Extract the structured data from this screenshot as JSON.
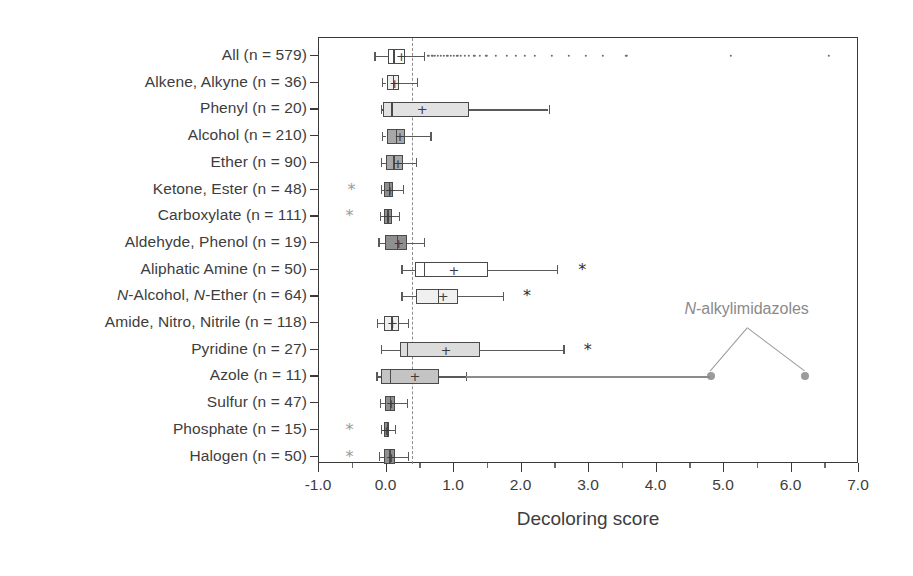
{
  "chart_data": {
    "type": "box",
    "title": "",
    "xlabel": "Decoloring score",
    "ylabel": "",
    "xlim": [
      -1.0,
      7.0
    ],
    "xticks": [
      "-1.0",
      "0.0",
      "1.0",
      "2.0",
      "3.0",
      "4.0",
      "5.0",
      "6.0",
      "7.0"
    ],
    "xtick_values": [
      -1.0,
      0.0,
      1.0,
      2.0,
      3.0,
      4.0,
      5.0,
      6.0,
      7.0
    ],
    "minor_ticks": true,
    "grid": false,
    "reference_line": {
      "value": 0.38,
      "style": "dashed",
      "color": "#8e8e8e"
    },
    "annotation": {
      "text_prefix": "N",
      "text_rest": "-alkylimidazoles",
      "x": 5.35,
      "points_x": [
        4.8,
        6.2
      ]
    },
    "categories": [
      "All (n = 579)",
      "Alkene, Alkyne (n = 36)",
      "Phenyl (n = 20)",
      "Alcohol (n = 210)",
      "Ether (n = 90)",
      "Ketone, Ester (n = 48)",
      "Carboxylate (n = 111)",
      "Aldehyde, Phenol (n = 19)",
      "Aliphatic Amine (n = 50)",
      "N-Alcohol, N-Ether (n = 64)",
      "Amide, Nitro, Nitrile (n = 118)",
      "Pyridine (n = 27)",
      "Azole (n = 11)",
      "Sulfur (n = 47)",
      "Phosphate (n = 15)",
      "Halogen (n = 50)"
    ],
    "boxes": [
      {
        "label": "All (n = 579)",
        "n": 579,
        "whisker_low": -0.18,
        "q1": 0.02,
        "median": 0.1,
        "q3": 0.28,
        "whisker_high": 0.55,
        "mean": 0.22,
        "fill": "#ffffff",
        "outliers": [
          0.62,
          0.68,
          0.72,
          0.76,
          0.8,
          0.85,
          0.9,
          0.95,
          1.0,
          1.05,
          1.1,
          1.16,
          1.22,
          1.3,
          1.38,
          1.48,
          1.62,
          1.78,
          1.92,
          2.05,
          2.2,
          2.45,
          2.7,
          2.95,
          3.2,
          3.55,
          5.1,
          6.55
        ],
        "left_asterisk": false,
        "right_asterisk": false
      },
      {
        "label": "Alkene, Alkyne (n = 36)",
        "n": 36,
        "whisker_low": -0.07,
        "q1": 0.0,
        "median": 0.09,
        "q3": 0.18,
        "whisker_high": 0.45,
        "mean": 0.12,
        "fill": "#efefef",
        "outliers": [],
        "left_asterisk": false,
        "right_asterisk": false
      },
      {
        "label": "Phenyl (n = 20)",
        "n": 20,
        "whisker_low": -0.08,
        "q1": -0.05,
        "median": 0.07,
        "q3": 1.22,
        "whisker_high": 2.4,
        "mean": 0.53,
        "fill": "#e2e2e2",
        "outliers": [],
        "left_asterisk": false,
        "right_asterisk": false
      },
      {
        "label": "Alcohol (n = 210)",
        "n": 210,
        "whisker_low": -0.07,
        "q1": 0.0,
        "median": 0.14,
        "q3": 0.28,
        "whisker_high": 0.65,
        "mean": 0.2,
        "fill": "#a8a8a8",
        "outliers": [],
        "left_asterisk": false,
        "right_asterisk": false
      },
      {
        "label": "Ether (n = 90)",
        "n": 90,
        "whisker_low": -0.08,
        "q1": -0.01,
        "median": 0.1,
        "q3": 0.24,
        "whisker_high": 0.44,
        "mean": 0.17,
        "fill": "#a8a8a8",
        "outliers": [],
        "left_asterisk": false,
        "right_asterisk": false
      },
      {
        "label": "Ketone, Ester (n = 48)",
        "n": 48,
        "whisker_low": -0.08,
        "q1": -0.03,
        "median": 0.03,
        "q3": 0.1,
        "whisker_high": 0.24,
        "mean": 0.05,
        "fill": "#8f8f8f",
        "outliers": [],
        "left_asterisk": true,
        "right_asterisk": false,
        "left_asterisk_x": -0.52
      },
      {
        "label": "Carboxylate (n = 111)",
        "n": 111,
        "whisker_low": -0.1,
        "q1": -0.04,
        "median": 0.01,
        "q3": 0.08,
        "whisker_high": 0.18,
        "mean": 0.02,
        "fill": "#8f8f8f",
        "outliers": [],
        "left_asterisk": true,
        "right_asterisk": false,
        "left_asterisk_x": -0.55
      },
      {
        "label": "Aldehyde, Phenol (n = 19)",
        "n": 19,
        "whisker_low": -0.12,
        "q1": -0.02,
        "median": 0.15,
        "q3": 0.3,
        "whisker_high": 0.56,
        "mean": 0.18,
        "fill": "#8f8f8f",
        "outliers": [],
        "left_asterisk": false,
        "right_asterisk": false
      },
      {
        "label": "Aliphatic Amine (n = 50)",
        "n": 50,
        "whisker_low": 0.22,
        "q1": 0.42,
        "median": 0.55,
        "q3": 1.5,
        "whisker_high": 2.52,
        "mean": 1.0,
        "fill": "#ffffff",
        "outliers": [],
        "left_asterisk": false,
        "right_asterisk": true,
        "right_asterisk_x": 2.9
      },
      {
        "label": "N-Alcohol, N-Ether (n = 64)",
        "n": 64,
        "whisker_low": 0.22,
        "q1": 0.44,
        "median": 0.76,
        "q3": 1.06,
        "whisker_high": 1.72,
        "mean": 0.84,
        "fill": "#f0f0f0",
        "outliers": [],
        "left_asterisk": false,
        "right_asterisk": true,
        "right_asterisk_x": 2.08,
        "italic_label": true
      },
      {
        "label": "Amide, Nitro, Nitrile (n = 118)",
        "n": 118,
        "whisker_low": -0.14,
        "q1": -0.04,
        "median": 0.07,
        "q3": 0.18,
        "whisker_high": 0.32,
        "mean": 0.09,
        "fill": "#efefef",
        "outliers": [],
        "left_asterisk": false,
        "right_asterisk": false
      },
      {
        "label": "Pyridine (n = 27)",
        "n": 27,
        "whisker_low": -0.08,
        "q1": 0.2,
        "median": 0.3,
        "q3": 1.38,
        "whisker_high": 2.62,
        "mean": 0.88,
        "fill": "#dcdcdc",
        "outliers": [],
        "left_asterisk": false,
        "right_asterisk": true,
        "right_asterisk_x": 2.98
      },
      {
        "label": "Azole (n = 11)",
        "n": 11,
        "whisker_low": -0.15,
        "q1": -0.08,
        "median": 0.05,
        "q3": 0.78,
        "whisker_high": 1.18,
        "mean": 0.42,
        "fill": "#c4c4c4",
        "outliers": [],
        "left_asterisk": false,
        "right_asterisk": false,
        "big_dots": [
          4.8,
          6.2
        ]
      },
      {
        "label": "Sulfur (n = 47)",
        "n": 47,
        "whisker_low": -0.1,
        "q1": -0.02,
        "median": 0.05,
        "q3": 0.13,
        "whisker_high": 0.3,
        "mean": 0.07,
        "fill": "#8f8f8f",
        "outliers": [],
        "left_asterisk": false,
        "right_asterisk": false
      },
      {
        "label": "Phosphate (n = 15)",
        "n": 15,
        "whisker_low": -0.08,
        "q1": -0.04,
        "median": 0.0,
        "q3": 0.04,
        "whisker_high": 0.12,
        "mean": 0.0,
        "fill": "#8f8f8f",
        "outliers": [],
        "left_asterisk": true,
        "right_asterisk": false,
        "left_asterisk_x": -0.55
      },
      {
        "label": "Halogen (n = 50)",
        "n": 50,
        "whisker_low": -0.11,
        "q1": -0.03,
        "median": 0.04,
        "q3": 0.12,
        "whisker_high": 0.32,
        "mean": 0.07,
        "fill": "#8f8f8f",
        "outliers": [],
        "left_asterisk": true,
        "right_asterisk": false,
        "left_asterisk_x": -0.55
      }
    ],
    "mean_marker": "+",
    "outlier_marker": "·",
    "asterisk_marker": "*"
  }
}
